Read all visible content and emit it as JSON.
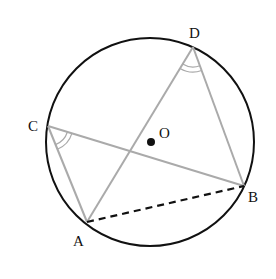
{
  "diagram": {
    "type": "circle-geometry",
    "circle": {
      "cx": 150,
      "cy": 142,
      "r": 104,
      "stroke": "#111111"
    },
    "center": {
      "name": "O",
      "x": 151,
      "y": 142,
      "label_x": 160,
      "label_y": 137
    },
    "points": {
      "A": {
        "label": "A",
        "x": 87,
        "y": 222,
        "label_x": 74,
        "label_y": 245
      },
      "B": {
        "label": "B",
        "x": 244,
        "y": 186,
        "label_x": 248,
        "label_y": 201
      },
      "C": {
        "label": "C",
        "x": 48,
        "y": 126,
        "label_x": 28,
        "label_y": 130
      },
      "D": {
        "label": "D",
        "x": 193,
        "y": 47,
        "label_x": 190,
        "label_y": 38
      }
    },
    "segments": [
      {
        "from": "C",
        "to": "A",
        "style": "solid",
        "color": "#aaaaaa"
      },
      {
        "from": "C",
        "to": "B",
        "style": "solid",
        "color": "#aaaaaa"
      },
      {
        "from": "D",
        "to": "A",
        "style": "solid",
        "color": "#aaaaaa"
      },
      {
        "from": "D",
        "to": "B",
        "style": "solid",
        "color": "#aaaaaa"
      },
      {
        "from": "A",
        "to": "B",
        "style": "dashed",
        "color": "#111111"
      }
    ],
    "angle_marks": [
      {
        "vertex": "C",
        "between": [
          "A",
          "B"
        ],
        "arcs": 2
      },
      {
        "vertex": "D",
        "between": [
          "A",
          "B"
        ],
        "arcs": 2
      }
    ],
    "labels": {
      "A": "A",
      "B": "B",
      "C": "C",
      "D": "D",
      "O": "O"
    }
  }
}
